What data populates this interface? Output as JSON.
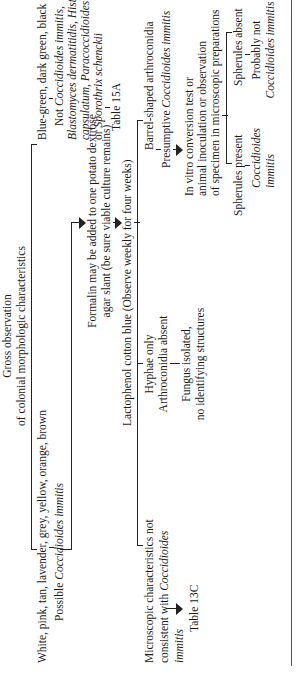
{
  "root": {
    "line1": "Gross observation",
    "line2": "of colonial morphologic characteristics"
  },
  "left_branch": {
    "colors": "White, pink, tan, lavender, grey, yellow, orange, brown",
    "possible_prefix": "Possible ",
    "possible_species": "Coccidioides immitis"
  },
  "right_branch": {
    "colors": "Blue-green, dark green, black",
    "not_prefix": "Not ",
    "not_species": "Coccidioides immitis,",
    "species_line1": "Blastomyces dermatitidis,",
    "species_line1b": " Histoplasma",
    "species_line2": "capsulatum,",
    "species_line2b": " Paracoccidioides brasiliensis,",
    "species_line3_prefix": "or ",
    "species_line3": "Sporothrix schenckii",
    "table_ref": "Table 15A"
  },
  "formalin": {
    "line1": "Formalin may be added to one potato dextrose",
    "line2": "agar slant (be sure viable culture remains)"
  },
  "lactophenol": {
    "text": "Lactophenol cotton blue (Observe weekly for four weeks)"
  },
  "outcomes": {
    "microscopic_not_consistent": {
      "line1": "Microscopic characteristics not",
      "line2_prefix": "consistent with ",
      "line2_species": "Coccidioides",
      "line3_species": "immitis",
      "table_ref": "Table 13C"
    },
    "hyphae_only": {
      "line1": "Hyphae only",
      "line2": "Arthroconidia absent",
      "result_line1": "Fungus isolated,",
      "result_line2": "no identifying structures"
    },
    "barrel_shaped": {
      "line1": "Barrel-shaped arthroconidia",
      "presumptive_prefix": "Presumptive ",
      "presumptive_species": "Coccidioides immitis",
      "test_line1": "In vitro conversion test or",
      "test_line2": "animal inoculation or observation",
      "test_line3": "of specimen in microscopic preparations",
      "spherules_present": {
        "label": "Spherules present",
        "result_line1": "Coccidioides",
        "result_line2": "immitis"
      },
      "spherules_absent": {
        "label": "Spherules absent",
        "result_line1": "Probably not",
        "result_line2": "Coccidioides immitis"
      }
    }
  }
}
